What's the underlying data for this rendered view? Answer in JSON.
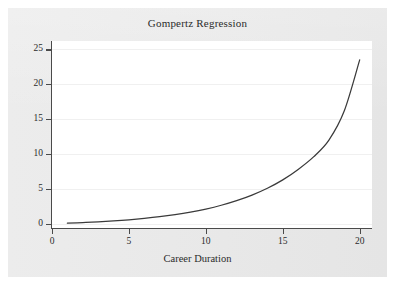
{
  "chart_data": {
    "type": "line",
    "title": "Gompertz Regression",
    "xlabel": "Career Duration",
    "ylabel": "",
    "xlim": [
      0,
      20.8
    ],
    "ylim": [
      -0.6,
      26.2
    ],
    "grid": true,
    "legend": null,
    "line_color": "#3a3a3a",
    "x_ticks": [
      0,
      5,
      10,
      15,
      20
    ],
    "x_tick_labels": [
      "0",
      "5",
      "10",
      "15",
      "20"
    ],
    "y_ticks": [
      0,
      5,
      10,
      15,
      20,
      25
    ],
    "y_tick_labels": [
      "0",
      "5",
      "10",
      "15",
      "20",
      "25"
    ],
    "series": [
      {
        "name": "Gompertz fit",
        "x": [
          1,
          2,
          3,
          4,
          5,
          6,
          7,
          8,
          9,
          10,
          11,
          12,
          13,
          14,
          15,
          16,
          17,
          18,
          19,
          20
        ],
        "values": [
          0.1,
          0.18,
          0.29,
          0.42,
          0.58,
          0.78,
          1.02,
          1.32,
          1.68,
          2.12,
          2.66,
          3.32,
          4.12,
          5.1,
          6.3,
          7.8,
          9.6,
          12.0,
          16.2,
          23.5
        ]
      }
    ]
  },
  "figure": {
    "background_color": "#e8e8e8",
    "plot_background_color": "#ffffff",
    "axis_color": "#4a4a4a",
    "gridline_color": "#f0f0f0"
  }
}
